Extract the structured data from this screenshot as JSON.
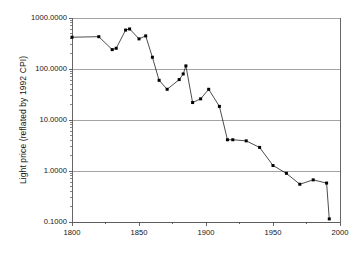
{
  "chart_data": {
    "type": "line",
    "title": "",
    "xlabel": "",
    "ylabel": "Light price (reflated by 1992 CPI)",
    "yscale": "log",
    "xscale": "linear",
    "xlim": [
      1800,
      2000
    ],
    "ylim": [
      0.1,
      1000
    ],
    "grid": true,
    "legend": null,
    "marker": "square",
    "marker_color": "#000000",
    "line_color": "#000000",
    "x": [
      1800,
      1820,
      1830,
      1833,
      1840,
      1843,
      1850,
      1855,
      1860,
      1865,
      1871,
      1880,
      1883,
      1885,
      1890,
      1896,
      1902,
      1910,
      1916,
      1920,
      1930,
      1940,
      1950,
      1960,
      1970,
      1980,
      1990,
      1992
    ],
    "values": [
      420,
      430,
      240,
      255,
      580,
      610,
      390,
      445,
      170,
      60,
      40,
      62,
      80,
      115,
      22,
      26,
      40,
      18.5,
      4.1,
      4.1,
      3.9,
      2.9,
      1.28,
      0.9,
      0.55,
      0.67,
      0.58,
      0.115
    ],
    "xticks": [
      1800,
      1850,
      1900,
      1950,
      2000
    ],
    "xtick_labels": [
      "1800",
      "1850",
      "1900",
      "1950",
      "2000"
    ],
    "yticks": [
      1000,
      100,
      10,
      1,
      0.1
    ],
    "ytick_labels": [
      "1000.0000",
      "100.0000",
      "10.0000",
      "1.0000",
      "0.1000"
    ],
    "x_minor_step": 25,
    "plot_frame": {
      "left": 72,
      "right": 340,
      "top": 18,
      "bottom": 222
    },
    "colors": {
      "background": "#ffffff",
      "plot_background": "#ffffff",
      "gridline": "#9a9a9a",
      "axis": "#555555",
      "text": "#141414"
    }
  }
}
